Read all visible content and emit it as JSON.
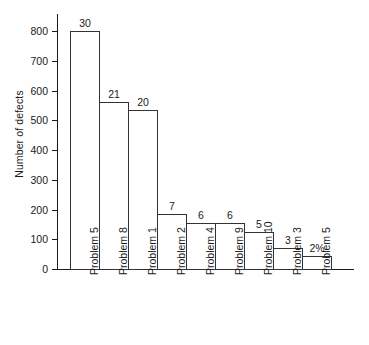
{
  "chart_data": {
    "type": "bar",
    "title": "",
    "xlabel": "",
    "ylabel": "Number of defects",
    "ylim": [
      0,
      800
    ],
    "yticks": [
      0,
      100,
      200,
      300,
      400,
      500,
      600,
      700,
      800
    ],
    "ytick_labels": [
      "0",
      "100",
      "200",
      "300",
      "400",
      "500",
      "600",
      "700",
      "800"
    ],
    "grid": false,
    "legend": "none",
    "categories": [
      "Problem 5",
      "Problem 8",
      "Problem 1",
      "Problem 2",
      "Problem 4",
      "Problem 9",
      "Problem 10",
      "Problem 3",
      "Problem 5"
    ],
    "values": [
      800,
      560,
      533,
      185,
      155,
      153,
      125,
      70,
      45
    ],
    "bar_labels": [
      "30",
      "21",
      "20",
      "7",
      "6",
      "6",
      "5",
      "3",
      "2%"
    ],
    "bar_style": {
      "fill": "#ffffff",
      "edge": "#333333",
      "gap": "none"
    },
    "axis_color": "#1a1a1a"
  }
}
